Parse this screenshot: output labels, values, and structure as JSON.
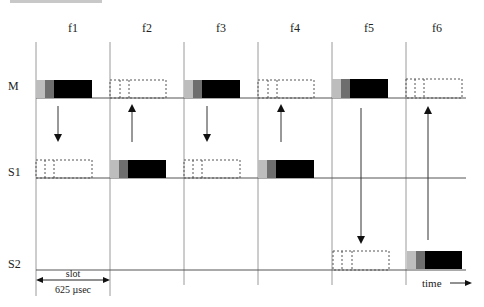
{
  "diagram": {
    "type": "tdd-slot-timing",
    "frequency_labels": [
      "f1",
      "f2",
      "f3",
      "f4",
      "f5",
      "f6"
    ],
    "rows": [
      {
        "label": "M",
        "y": 98
      },
      {
        "label": "S1",
        "y": 178
      },
      {
        "label": "S2",
        "y": 270
      }
    ],
    "slot_boundaries_x": [
      36,
      110,
      184,
      258,
      332,
      406
    ],
    "packets": [
      {
        "row": "M",
        "slot": 0,
        "style": "solid"
      },
      {
        "row": "M",
        "slot": 1,
        "style": "dashed"
      },
      {
        "row": "M",
        "slot": 2,
        "style": "solid"
      },
      {
        "row": "M",
        "slot": 3,
        "style": "dashed"
      },
      {
        "row": "M",
        "slot": 4,
        "style": "solid"
      },
      {
        "row": "M",
        "slot": 5,
        "style": "dashed"
      },
      {
        "row": "S1",
        "slot": 0,
        "style": "dashed"
      },
      {
        "row": "S1",
        "slot": 1,
        "style": "solid"
      },
      {
        "row": "S1",
        "slot": 2,
        "style": "dashed"
      },
      {
        "row": "S1",
        "slot": 3,
        "style": "solid"
      },
      {
        "row": "S2",
        "slot": 4,
        "style": "dashed"
      },
      {
        "row": "S2",
        "slot": 5,
        "style": "solid"
      }
    ],
    "arrows": [
      {
        "x": 58,
        "from": "M",
        "to": "S1",
        "direction": "down"
      },
      {
        "x": 132,
        "from": "S1",
        "to": "M",
        "direction": "up"
      },
      {
        "x": 207,
        "from": "M",
        "to": "S1",
        "direction": "down"
      },
      {
        "x": 281,
        "from": "S1",
        "to": "M",
        "direction": "up"
      },
      {
        "x": 361,
        "from": "M",
        "to": "S2",
        "direction": "down"
      },
      {
        "x": 428,
        "from": "S2",
        "to": "M",
        "direction": "up"
      }
    ],
    "slot_annotation": {
      "top": "slot",
      "bottom": "625 µsec"
    },
    "time_label": "time",
    "colors": {
      "preamble_light": "#bdbdbd",
      "header_dark": "#6e6e6e",
      "payload": "#000000",
      "lines": "#555555",
      "dashed_grid": "#9a9a9a"
    }
  }
}
